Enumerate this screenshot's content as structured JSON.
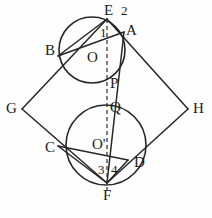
{
  "figure": {
    "stroke_color": "#262626",
    "background_color": "#fefefe",
    "label_color": "#1a1a1a",
    "dashed_axis": {
      "name": "EF",
      "from": "E",
      "to": "F",
      "style": "dashed"
    },
    "circles": [
      {
        "id": "upper",
        "center_label": "O",
        "cx": 92,
        "cy": 50,
        "r": 33
      },
      {
        "id": "lower",
        "center_label": "O'",
        "cx": 106,
        "cy": 145,
        "r": 40
      }
    ],
    "points": [
      {
        "label": "E",
        "x": 107,
        "y": 19,
        "lx": 104,
        "ly": 3,
        "kind": "vertex"
      },
      {
        "label": "A",
        "x": 124,
        "y": 32,
        "lx": 126,
        "ly": 23,
        "kind": "vertex"
      },
      {
        "label": "B",
        "x": 58,
        "y": 56,
        "lx": 45,
        "ly": 43,
        "kind": "vertex"
      },
      {
        "label": "O",
        "x": 92,
        "y": 50,
        "lx": 87,
        "ly": 50,
        "kind": "center"
      },
      {
        "label": "P",
        "x": 107,
        "y": 84,
        "lx": 110,
        "ly": 76,
        "kind": "point"
      },
      {
        "label": "Q",
        "x": 107,
        "y": 107,
        "lx": 110,
        "ly": 100,
        "kind": "point"
      },
      {
        "label": "G",
        "x": 22,
        "y": 109,
        "lx": 6,
        "ly": 101,
        "kind": "vertex"
      },
      {
        "label": "H",
        "x": 188,
        "y": 109,
        "lx": 193,
        "ly": 101,
        "kind": "vertex"
      },
      {
        "label": "C",
        "x": 58,
        "y": 146,
        "lx": 45,
        "ly": 140,
        "kind": "vertex"
      },
      {
        "label": "O'",
        "x": 106,
        "y": 145,
        "lx": 92,
        "ly": 137,
        "kind": "center"
      },
      {
        "label": "D",
        "x": 128,
        "y": 160,
        "lx": 134,
        "ly": 155,
        "kind": "vertex"
      },
      {
        "label": "F",
        "x": 107,
        "y": 183,
        "lx": 103,
        "ly": 188,
        "kind": "vertex"
      }
    ],
    "angle_labels": [
      {
        "label": "1",
        "x": 100,
        "y": 26
      },
      {
        "label": "2",
        "x": 121,
        "y": 4
      },
      {
        "label": "3",
        "x": 98,
        "y": 163
      },
      {
        "label": "4",
        "x": 111,
        "y": 163
      }
    ],
    "segments": [
      {
        "name": "G-E",
        "x1": 22,
        "y1": 109,
        "x2": 107,
        "y2": 19
      },
      {
        "name": "E-H",
        "x1": 107,
        "y1": 19,
        "x2": 188,
        "y2": 109
      },
      {
        "name": "H-F",
        "x1": 188,
        "y1": 109,
        "x2": 107,
        "y2": 183
      },
      {
        "name": "F-G",
        "x1": 107,
        "y1": 183,
        "x2": 22,
        "y2": 109
      },
      {
        "name": "E-B",
        "x1": 107,
        "y1": 19,
        "x2": 58,
        "y2": 56
      },
      {
        "name": "B-A",
        "x1": 58,
        "y1": 56,
        "x2": 124,
        "y2": 32
      },
      {
        "name": "F-C",
        "x1": 107,
        "y1": 183,
        "x2": 58,
        "y2": 146
      },
      {
        "name": "C-D",
        "x1": 58,
        "y1": 146,
        "x2": 128,
        "y2": 160
      },
      {
        "name": "F-D",
        "x1": 107,
        "y1": 183,
        "x2": 128,
        "y2": 160
      },
      {
        "name": "F-A-extend",
        "x1": 107,
        "y1": 183,
        "x2": 124,
        "y2": 32
      }
    ],
    "dashed_segment": {
      "name": "E-F-axis",
      "x1": 107,
      "y1": 19,
      "x2": 107,
      "y2": 190
    }
  }
}
